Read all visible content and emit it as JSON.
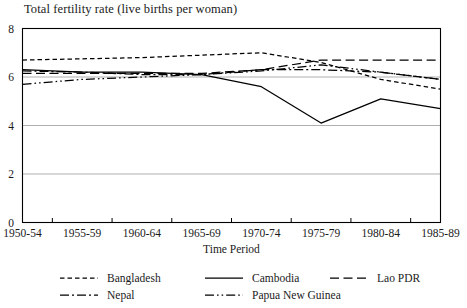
{
  "chart_data": {
    "type": "line",
    "title": "Total fertility rate (live births per woman)",
    "xlabel": "Time Period",
    "ylabel": "",
    "categories": [
      "1950-54",
      "1955-59",
      "1960-64",
      "1965-69",
      "1970-74",
      "1975-79",
      "1980-84",
      "1985-89"
    ],
    "ylim": [
      0,
      8
    ],
    "yticks": [
      0,
      2,
      4,
      6,
      8
    ],
    "grid": "horizontal",
    "legend_position": "below",
    "series": [
      {
        "name": "Bangladesh",
        "dash": "short-dash",
        "values": [
          6.7,
          6.75,
          6.8,
          6.9,
          7.0,
          6.6,
          5.9,
          5.5
        ]
      },
      {
        "name": "Cambodia",
        "dash": "solid",
        "values": [
          6.3,
          6.2,
          6.2,
          6.1,
          5.6,
          4.1,
          5.1,
          4.7
        ]
      },
      {
        "name": "Lao PDR",
        "dash": "long-dash",
        "values": [
          6.15,
          6.15,
          6.15,
          6.15,
          6.3,
          6.7,
          6.7,
          6.7
        ]
      },
      {
        "name": "Nepal",
        "dash": "dash-dot",
        "values": [
          6.25,
          6.2,
          6.1,
          6.1,
          6.3,
          6.3,
          6.2,
          5.9
        ]
      },
      {
        "name": "Papua New Guinea",
        "dash": "dash-dot-dot",
        "values": [
          5.7,
          5.9,
          6.0,
          6.1,
          6.25,
          6.5,
          6.2,
          5.9
        ]
      }
    ]
  },
  "legend": {
    "items": [
      {
        "label": "Bangladesh"
      },
      {
        "label": "Cambodia"
      },
      {
        "label": "Lao PDR"
      },
      {
        "label": "Nepal"
      },
      {
        "label": "Papua New Guinea"
      }
    ]
  }
}
